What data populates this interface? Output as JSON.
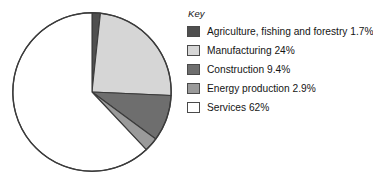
{
  "chart_data": {
    "type": "pie",
    "title": "",
    "legend_title": "Key",
    "legend_position": "right",
    "start_angle_deg": 0,
    "direction": "clockwise",
    "categories": [
      "Agriculture, fishing and forestry",
      "Manufacturing",
      "Construction",
      "Energy production",
      "Services"
    ],
    "values": [
      1.7,
      24,
      9.4,
      2.9,
      62
    ],
    "value_unit": "%",
    "labels": [
      "Agriculture, fishing and forestry 1.7%",
      "Manufacturing 24%",
      "Construction 9.4%",
      "Energy production 2.9%",
      "Services 62%"
    ],
    "colors": [
      "#4f4f4f",
      "#d6d6d6",
      "#6e6e6e",
      "#9a9a9a",
      "#ffffff"
    ],
    "stroke_color": "#3b3b3b",
    "center": [
      92,
      92
    ],
    "radius": 80
  },
  "legend": {
    "title": "Key",
    "items": [
      {
        "label": "Agriculture, fishing and forestry 1.7%",
        "color": "#4f4f4f",
        "value": 1.7
      },
      {
        "label": "Manufacturing 24%",
        "color": "#d6d6d6",
        "value": 24
      },
      {
        "label": "Construction 9.4%",
        "color": "#6e6e6e",
        "value": 9.4
      },
      {
        "label": "Energy production 2.9%",
        "color": "#9a9a9a",
        "value": 2.9
      },
      {
        "label": "Services 62%",
        "color": "#ffffff",
        "value": 62
      }
    ]
  }
}
